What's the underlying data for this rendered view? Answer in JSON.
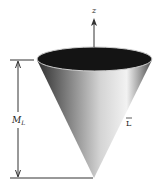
{
  "figure": {
    "type": "cone-diagram",
    "axis_label": "z",
    "dimension_label_main": "M",
    "dimension_label_sub": "L",
    "side_label": "L",
    "colors": {
      "background": "#ffffff",
      "cone_dark": "#3a3a3a",
      "cone_light": "#e8e8e8",
      "opening": "#111111",
      "lines": "#333333"
    }
  }
}
